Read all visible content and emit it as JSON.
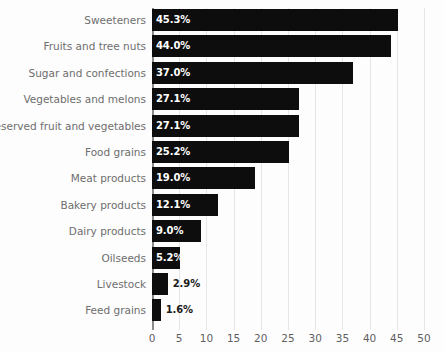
{
  "chart_data": {
    "type": "bar",
    "orientation": "horizontal",
    "title": "",
    "subtitle": "",
    "xlabel": "",
    "ylabel": "",
    "xlim": [
      0,
      50
    ],
    "xticks": [
      "0",
      "5",
      "10",
      "15",
      "20",
      "25",
      "30",
      "35",
      "40",
      "45",
      "50"
    ],
    "xtick_values": [
      0,
      5,
      10,
      15,
      20,
      25,
      30,
      35,
      40,
      45,
      50
    ],
    "grid": true,
    "legend": null,
    "categories": [
      "Sweeteners",
      "Fruits and tree nuts",
      "Sugar and confections",
      "Vegetables and melons",
      "Preserved fruit and vegetables",
      "Food grains",
      "Meat products",
      "Bakery products",
      "Dairy products",
      "Oilseeds",
      "Livestock",
      "Feed grains"
    ],
    "values": [
      45.3,
      44.0,
      37.0,
      27.1,
      27.1,
      25.2,
      19.0,
      12.1,
      9.0,
      5.2,
      2.9,
      1.6
    ],
    "data_labels": [
      "45.3%",
      "44.0%",
      "37.0%",
      "27.1%",
      "27.1%",
      "25.2%",
      "19.0%",
      "12.1%",
      "9.0%",
      "5.2%",
      "2.9%",
      "1.6%"
    ],
    "label_placement": [
      "inside",
      "inside",
      "inside",
      "inside",
      "inside",
      "inside",
      "inside",
      "inside",
      "inside",
      "inside",
      "outside",
      "outside"
    ],
    "bar_color": "#0d0d0d",
    "label_color_inside": "#ffffff",
    "label_color_outside": "#1a1a1a",
    "category_label_color": "#6e6e6e",
    "tick_label_color": "#5f5f5f",
    "gridline_color": "#e6e6e6",
    "axis_color": "#8a8a8a",
    "background_color": "#fdfdfd"
  }
}
